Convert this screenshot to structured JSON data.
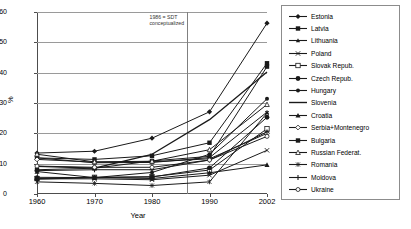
{
  "chart_data": {
    "type": "line",
    "title": "",
    "xlabel": "Year",
    "ylabel": "%",
    "x": [
      1960,
      1970,
      1980,
      1990,
      2002
    ],
    "xtick_labels": [
      "1960",
      "1970",
      "1980",
      "1990",
      "2002"
    ],
    "ytick_labels": [
      "0",
      "10",
      "20",
      "30",
      "40",
      "50",
      "60"
    ],
    "yticks": [
      0,
      10,
      20,
      30,
      40,
      50,
      60
    ],
    "ylim": [
      0,
      60
    ],
    "grid": "horizontal",
    "legend_position": "right",
    "annotations": [
      {
        "name": "sdt-marker",
        "text_line_1": "1986 = SDT",
        "text_line_2": "conceptualized",
        "x_value": 1986,
        "type": "vertical-line"
      }
    ],
    "series": [
      {
        "name": "Estonia",
        "marker": "diamond",
        "values": [
          13.5,
          14.1,
          18.4,
          27.1,
          56.3
        ]
      },
      {
        "name": "Latvia",
        "marker": "square",
        "values": [
          11.9,
          11.4,
          12.6,
          16.9,
          43.1
        ]
      },
      {
        "name": "Lithuania",
        "marker": "triangle-small",
        "values": [
          11.9,
          10.3,
          10.4,
          12.0,
          27.0
        ]
      },
      {
        "name": "Poland",
        "marker": "cross",
        "values": [
          5.0,
          5.0,
          4.7,
          6.2,
          14.4
        ]
      },
      {
        "name": "Slovak Repub.",
        "marker": "square-open",
        "values": [
          5.1,
          5.5,
          5.7,
          7.9,
          21.5
        ]
      },
      {
        "name": "Czech Repub.",
        "marker": "circle-filled",
        "values": [
          4.9,
          5.4,
          5.6,
          8.6,
          25.3
        ]
      },
      {
        "name": "Hungary",
        "marker": "circle-small",
        "values": [
          5.5,
          5.4,
          7.1,
          13.1,
          31.4
        ]
      },
      {
        "name": "Slovenia",
        "marker": "line-only",
        "values": [
          9.1,
          8.5,
          13.1,
          24.5,
          40.2
        ]
      },
      {
        "name": "Croatia",
        "marker": "triangle-filled",
        "values": [
          7.4,
          5.4,
          5.1,
          7.0,
          9.6
        ]
      },
      {
        "name": "Serbia+Montenegro",
        "marker": "diamond-open",
        "values": [
          11.4,
          10.5,
          10.6,
          11.6,
          20.0
        ]
      },
      {
        "name": "Bulgaria",
        "marker": "square-filled",
        "values": [
          8.0,
          8.5,
          10.9,
          12.4,
          42.0
        ]
      },
      {
        "name": "Russian Federat.",
        "marker": "triangle-open",
        "values": [
          13.1,
          10.6,
          10.8,
          14.6,
          29.5
        ]
      },
      {
        "name": "Romania",
        "marker": "asterisk",
        "values": [
          4.0,
          3.5,
          2.8,
          4.0,
          26.7
        ]
      },
      {
        "name": "Moldova",
        "marker": "plus",
        "values": [
          7.7,
          8.0,
          8.0,
          11.2,
          20.5
        ]
      },
      {
        "name": "Ukraine",
        "marker": "circle-open",
        "values": [
          9.2,
          8.8,
          8.8,
          11.2,
          19.0
        ]
      }
    ]
  },
  "legend": {
    "items": [
      {
        "label": "Estonia"
      },
      {
        "label": "Latvia"
      },
      {
        "label": "Lithuania"
      },
      {
        "label": "Poland"
      },
      {
        "label": "Slovak Repub."
      },
      {
        "label": "Czech Repub."
      },
      {
        "label": "Hungary"
      },
      {
        "label": "Slovenia"
      },
      {
        "label": "Croatia"
      },
      {
        "label": "Serbia+Montenegro"
      },
      {
        "label": "Bulgaria"
      },
      {
        "label": "Russian Federat."
      },
      {
        "label": "Romania"
      },
      {
        "label": "Moldova"
      },
      {
        "label": "Ukraine"
      }
    ]
  },
  "colors": {
    "line": "#1a1a1a",
    "grid": "#9a9a9a",
    "axis": "#4d4d4d",
    "annotation": "#808080",
    "background": "#ffffff",
    "legend_border": "#8c8c8c"
  }
}
